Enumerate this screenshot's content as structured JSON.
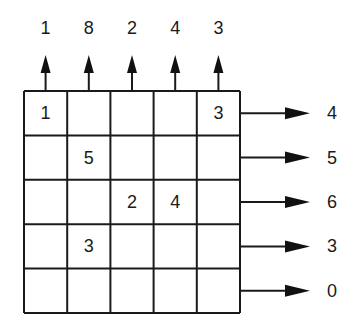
{
  "diagram": {
    "type": "grid-projection",
    "rows": 5,
    "cols": 5,
    "cells": [
      [
        "1",
        "",
        "",
        "",
        "3"
      ],
      [
        "",
        "5",
        "",
        "",
        ""
      ],
      [
        "",
        "",
        "2",
        "4",
        ""
      ],
      [
        "",
        "3",
        "",
        "",
        ""
      ],
      [
        "",
        "",
        "",
        "",
        ""
      ]
    ],
    "column_outputs": [
      "1",
      "8",
      "2",
      "4",
      "3"
    ],
    "row_outputs": [
      "4",
      "5",
      "6",
      "3",
      "0"
    ],
    "column_arrow_direction": "up",
    "row_arrow_direction": "right",
    "colors": {
      "line": "#1a1a1a",
      "text": "#1a1a1a",
      "background": "#ffffff"
    }
  }
}
